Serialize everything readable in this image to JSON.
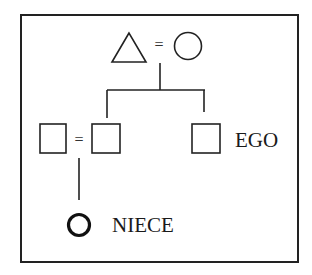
{
  "diagram": {
    "type": "kinship-chart",
    "frame": {
      "stroke": "#222222"
    },
    "generation_1": {
      "father": {
        "symbol": "triangle",
        "label": ""
      },
      "marriage_sign": "=",
      "mother": {
        "symbol": "circle",
        "label": ""
      }
    },
    "generation_2": {
      "sibling_spouse": {
        "symbol": "square",
        "label": ""
      },
      "marriage_sign": "=",
      "sibling": {
        "symbol": "square",
        "label": ""
      },
      "ego": {
        "symbol": "square",
        "label": "EGO"
      }
    },
    "generation_3": {
      "niece": {
        "symbol": "circle",
        "label": "NIECE",
        "highlighted": true
      }
    }
  }
}
